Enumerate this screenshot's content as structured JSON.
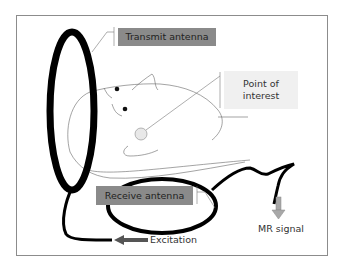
{
  "diagram": {
    "type": "MRI antenna schematic",
    "frame_color": "#8c8c8c",
    "labels": {
      "transmit_antenna": "Transmit antenna",
      "point_of_interest_line1": "Point of",
      "point_of_interest_line2": "interest",
      "receive_antenna": "Receive antenna",
      "excitation": "Excitation",
      "mr_signal": "MR signal"
    },
    "colors": {
      "antenna": "#000000",
      "dark_label_bg": "#8a8a8a",
      "light_label_bg": "#f0f0f0",
      "excitation_arrow": "#555555",
      "mr_signal_arrow": "#a8a8a8",
      "point_marker": "#e8e8e8"
    }
  }
}
